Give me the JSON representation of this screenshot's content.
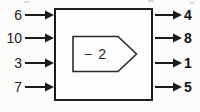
{
  "diagram": {
    "operation_label": "− 2",
    "inputs": [
      "6",
      "10",
      "3",
      "7"
    ],
    "outputs": [
      "4",
      "8",
      "1",
      "5"
    ],
    "colors": {
      "line": "#1c1c1c",
      "background": "#fbfbfa",
      "box_fill": "#fdfdfc"
    }
  }
}
